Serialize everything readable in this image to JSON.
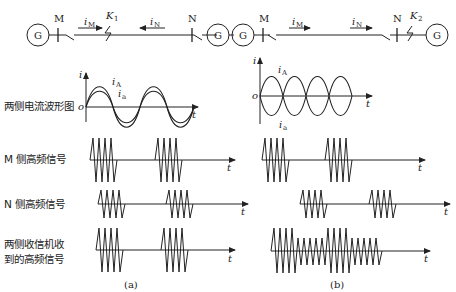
{
  "panels": {
    "a": {
      "caption": "(a)",
      "circuit": {
        "generator_left": "G",
        "generator_right": "G",
        "bus_left": "M",
        "bus_right": "N",
        "current_left": "i",
        "current_left_sub": "M",
        "current_right": "i",
        "current_right_sub": "N",
        "fault": "K",
        "fault_sub": "1",
        "fault_location": "internal (between M and N)"
      }
    },
    "b": {
      "caption": "(b)",
      "circuit": {
        "generator_left": "G",
        "generator_right": "G",
        "bus_left": "M",
        "bus_right": "N",
        "current_left": "i",
        "current_left_sub": "M",
        "current_right": "i",
        "current_right_sub": "N",
        "fault": "K",
        "fault_sub": "2",
        "fault_location": "external (beyond N)"
      }
    }
  },
  "row_labels": {
    "current_waveform": "两侧电流波形图",
    "m_signal": "M 侧高频信号",
    "n_signal": "N 侧高频信号",
    "received_line1": "两侧收信机收",
    "received_line2": "到的高频信号"
  },
  "axes": {
    "i_label": "i",
    "t_label": "t",
    "origin": "o",
    "iA": "i",
    "iA_sub": "A",
    "iB": "i",
    "iB_sub": "a"
  }
}
